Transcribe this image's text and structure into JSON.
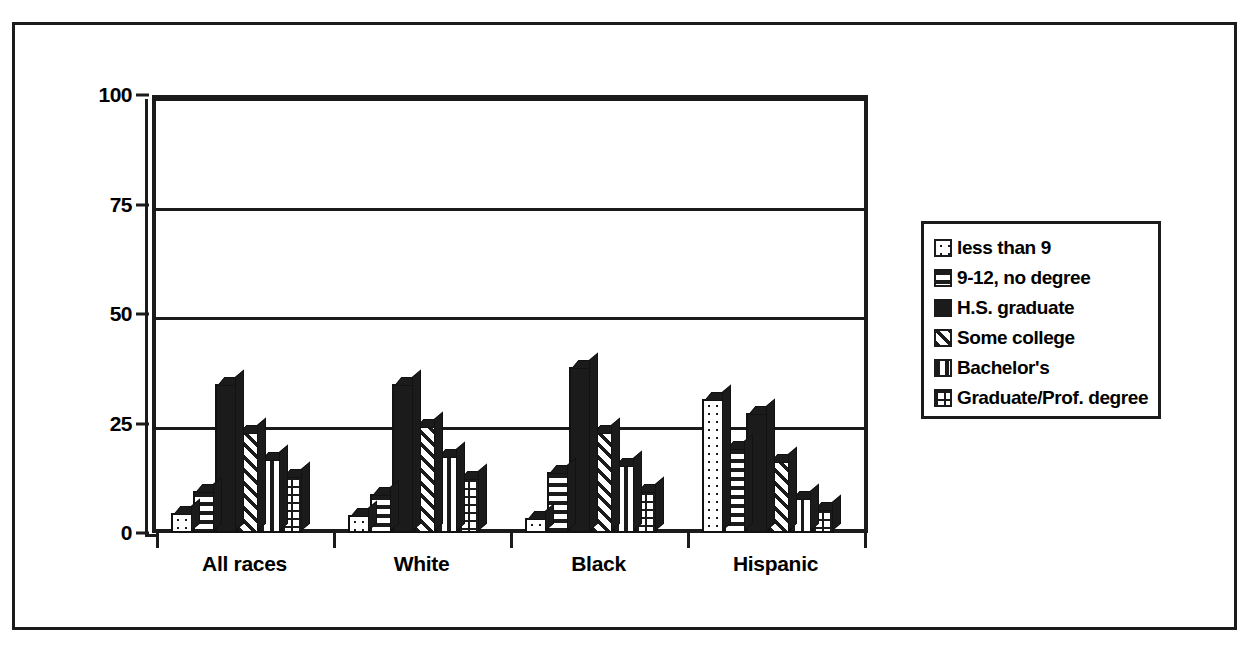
{
  "chart_data": {
    "type": "bar",
    "title": "",
    "xlabel": "",
    "ylabel": "",
    "ylim": [
      0,
      100
    ],
    "yticks": [
      0,
      25,
      50,
      75,
      100
    ],
    "ytick_labels": [
      "0",
      "25",
      "50",
      "75",
      "100"
    ],
    "grid": true,
    "legend_position": "right",
    "categories": [
      "All races",
      "White",
      "Black",
      "Hispanic"
    ],
    "series": [
      {
        "name": "less than 9",
        "pattern": "dots",
        "values": [
          4.5,
          4.0,
          3.5,
          30.5
        ]
      },
      {
        "name": "9-12, no degree",
        "pattern": "hlines",
        "values": [
          9.5,
          9.0,
          14.0,
          19.5
        ]
      },
      {
        "name": "H.S. graduate",
        "pattern": "solid",
        "values": [
          34.0,
          34.0,
          38.0,
          27.5
        ]
      },
      {
        "name": "Some college",
        "pattern": "diag",
        "values": [
          23.0,
          24.5,
          23.0,
          16.5
        ]
      },
      {
        "name": "Bachelor's",
        "pattern": "vlines",
        "values": [
          17.0,
          17.5,
          15.5,
          8.0
        ]
      },
      {
        "name": "Graduate/Prof. degree",
        "pattern": "grid",
        "values": [
          13.0,
          12.5,
          9.5,
          5.5
        ]
      }
    ]
  },
  "legend": {
    "items": [
      {
        "label": "less than 9"
      },
      {
        "label": "9-12, no degree"
      },
      {
        "label": "H.S. graduate"
      },
      {
        "label": "Some college"
      },
      {
        "label": "Bachelor's"
      },
      {
        "label": "Graduate/Prof. degree"
      }
    ]
  },
  "axes": {
    "y_labels": [
      "100",
      "75",
      "50",
      "25",
      "0"
    ],
    "x_labels": [
      "All races",
      "White",
      "Black",
      "Hispanic"
    ]
  },
  "colors": {
    "ink": "#1b1b1b",
    "paper": "#ffffff"
  }
}
